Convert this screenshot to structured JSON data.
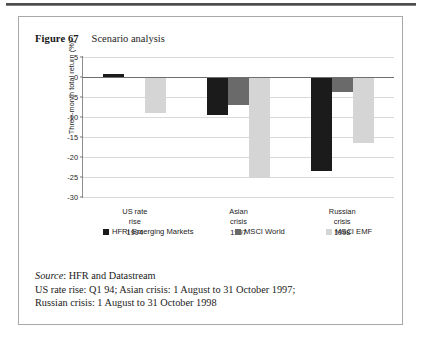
{
  "figure": {
    "number": "Figure 67",
    "title": "Scenario analysis"
  },
  "footnotes": {
    "source_label": "Source",
    "source_rest": ": HFR and Datastream",
    "line2": "US rate rise: Q1 94; Asian crisis: 1 August to 31 October 1997;",
    "line3": "Russian crisis: 1 August to 31 October 1998"
  },
  "colors": {
    "series_0": "#1b1b1b",
    "series_1": "#6a6a6a",
    "series_2": "#d5d5d5",
    "gridline": "#d9d9d9",
    "axis": "#8d8d8d",
    "box_border": "#a8a8a8"
  },
  "chart_data": {
    "type": "bar",
    "title": "Scenario analysis",
    "xlabel": "",
    "ylabel": "Three-month total return (%)",
    "ylim": [
      -30,
      5
    ],
    "yticks": [
      5,
      0,
      -5,
      -10,
      -15,
      -20,
      -25,
      -30
    ],
    "ytick_labels": [
      "5",
      "0",
      "-5",
      "-10",
      "-15",
      "-20",
      "-25",
      "-30"
    ],
    "grid": true,
    "legend_position": "bottom",
    "categories": [
      "US rate\nrise\n1994",
      "Asian\ncrisis\n1997",
      "Russian\ncrisis\n1998"
    ],
    "category_lines": [
      [
        "US rate",
        "rise",
        "1994"
      ],
      [
        "Asian",
        "crisis",
        "1997"
      ],
      [
        "Russian",
        "crisis",
        "1998"
      ]
    ],
    "series": [
      {
        "name": "HFRI Emerging Markets",
        "color": "#1b1b1b",
        "values": [
          0.7,
          -9.4,
          -23.5
        ]
      },
      {
        "name": "MSCI World",
        "color": "#6a6a6a",
        "values": [
          -0.2,
          -7.0,
          -3.8
        ]
      },
      {
        "name": "MSCI EMF",
        "color": "#d5d5d5",
        "values": [
          -9.1,
          -25.3,
          -16.5
        ]
      }
    ]
  }
}
